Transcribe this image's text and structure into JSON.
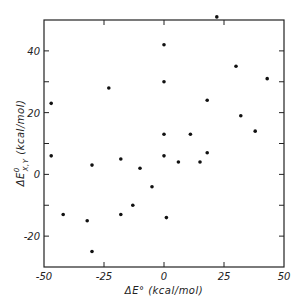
{
  "chart_data": {
    "type": "scatter",
    "title": "",
    "xlabel": "ΔE° (kcal/mol)",
    "ylabel": "ΔE°X,Y (kcal/mol)",
    "ylabel_parts": {
      "prefix": "ΔE",
      "superscript": "0",
      "subscript": "X,Y",
      "suffix": " (kcal/mol)"
    },
    "xlim": [
      -50,
      50
    ],
    "ylim": [
      -30,
      50
    ],
    "xticks": [
      -50,
      -25,
      0,
      25,
      50
    ],
    "xtick_labels": [
      "-50",
      "-25",
      "0",
      "25",
      "50"
    ],
    "yticks": [
      -20,
      -10,
      0,
      10,
      20,
      30,
      40
    ],
    "ytick_labels": {
      "-20": "-20",
      "0": "0",
      "20": "20",
      "40": "40"
    },
    "grid": false,
    "legend": null,
    "series": [
      {
        "name": "data",
        "color": "#111111",
        "points": [
          {
            "x": -47,
            "y": 23
          },
          {
            "x": -47,
            "y": 6
          },
          {
            "x": -42,
            "y": -13
          },
          {
            "x": -30,
            "y": -25
          },
          {
            "x": -32,
            "y": -15
          },
          {
            "x": -30,
            "y": 3
          },
          {
            "x": -23,
            "y": 28
          },
          {
            "x": -18,
            "y": 5
          },
          {
            "x": -18,
            "y": -13
          },
          {
            "x": -13,
            "y": -10
          },
          {
            "x": -10,
            "y": 2
          },
          {
            "x": -5,
            "y": -4
          },
          {
            "x": 0,
            "y": 42
          },
          {
            "x": 0,
            "y": 30
          },
          {
            "x": 0,
            "y": 13
          },
          {
            "x": 0,
            "y": 6
          },
          {
            "x": 1,
            "y": -14
          },
          {
            "x": 6,
            "y": 4
          },
          {
            "x": 11,
            "y": 13
          },
          {
            "x": 15,
            "y": 4
          },
          {
            "x": 18,
            "y": 7
          },
          {
            "x": 18,
            "y": 24
          },
          {
            "x": 22,
            "y": 51
          },
          {
            "x": 30,
            "y": 35
          },
          {
            "x": 32,
            "y": 19
          },
          {
            "x": 38,
            "y": 14
          },
          {
            "x": 43,
            "y": 31
          }
        ]
      }
    ]
  },
  "layout": {
    "plot_left": 44,
    "plot_right": 284,
    "plot_top": 20,
    "plot_bottom": 267
  }
}
